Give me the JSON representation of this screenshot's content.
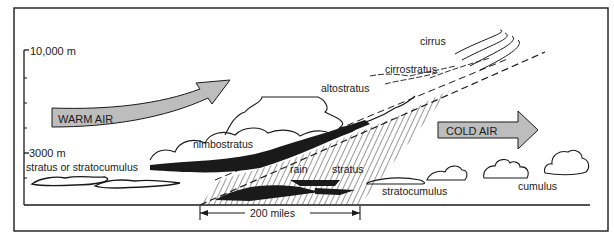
{
  "diagram": {
    "axis": {
      "top_label": "10,000 m",
      "mid_label": "3000 m"
    },
    "air_masses": {
      "warm": "WARM AIR",
      "cold": "COLD AIR"
    },
    "clouds": {
      "cirrus": "cirrus",
      "cirrostratus": "cirrostratus",
      "altostratus": "altostratus",
      "nimbostratus": "nimbostratus",
      "stratus_or_stratocumulus": "stratus or stratocumulus",
      "stratocumulus": "stratocumulus",
      "cumulus": "cumulus",
      "stratus": "stratus"
    },
    "precipitation": {
      "rain": "rain"
    },
    "scale": {
      "distance": "200 miles"
    },
    "colors": {
      "arrow_fill": "#bdbdbd",
      "ink": "#1a1a1a",
      "background": "#ffffff"
    }
  }
}
